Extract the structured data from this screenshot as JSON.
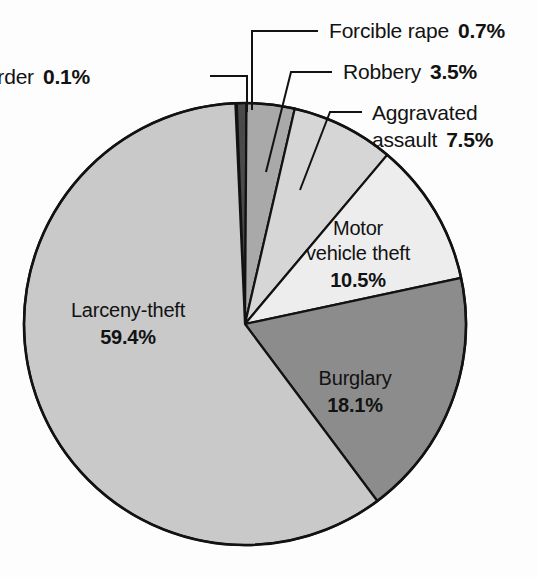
{
  "chart_data": {
    "type": "pie",
    "title": "",
    "subtitle": "",
    "xlabel": "",
    "ylabel": "",
    "legend_position": "none",
    "grid": false,
    "units": "percent",
    "total": 99.8,
    "categories": [
      "Murder",
      "Forcible rape",
      "Robbery",
      "Aggravated assault",
      "Motor vehicle theft",
      "Burglary",
      "Larceny-theft"
    ],
    "values": [
      0.1,
      0.7,
      3.5,
      7.5,
      10.5,
      18.1,
      59.4
    ],
    "slices": [
      {
        "name": "Murder",
        "label": "Murder",
        "value": 0.1,
        "value_text": "0.1%",
        "color": "#1e1e1e",
        "label_placement": "outside-left",
        "text_x": 90,
        "text_y": 84,
        "leader": "M 210 76 L 247 76 L 247 112"
      },
      {
        "name": "Forcible rape",
        "label": "Forcible rape",
        "value": 0.7,
        "value_text": "0.7%",
        "color": "#4a4a4a",
        "label_placement": "outside-right",
        "text_x": 329,
        "text_y": 38,
        "leader": "M 318 31 L 252 31 L 252 110"
      },
      {
        "name": "Robbery",
        "label": "Robbery",
        "value": 3.5,
        "value_text": "3.5%",
        "color": "#a9a9a9",
        "label_placement": "outside-right",
        "text_x": 343,
        "text_y": 79,
        "leader": "M 332 72 L 291 72 L 266 172"
      },
      {
        "name": "Aggravated assault",
        "label": "Aggravated assault",
        "label_line1": "Aggravated",
        "label_line2": "assault",
        "value": 7.5,
        "value_text": "7.5%",
        "color": "#d6d6d6",
        "label_placement": "outside-right",
        "text_x": 372,
        "text_y": 120,
        "leader": "M 362 112 L 330 112 L 300 190"
      },
      {
        "name": "Motor vehicle theft",
        "label": "Motor vehicle theft",
        "label_line1": "Motor",
        "label_line2": "vehicle theft",
        "value": 10.5,
        "value_text": "10.5%",
        "color": "#ededed",
        "label_placement": "inside",
        "text_x": 358,
        "text_y": 235
      },
      {
        "name": "Burglary",
        "label": "Burglary",
        "value": 18.1,
        "value_text": "18.1%",
        "color": "#8c8c8c",
        "label_placement": "inside",
        "text_x": 355,
        "text_y": 385
      },
      {
        "name": "Larceny-theft",
        "label": "Larceny-theft",
        "value": 59.4,
        "value_text": "59.4%",
        "color": "#c9c9c9",
        "label_placement": "inside",
        "text_x": 128,
        "text_y": 317
      }
    ],
    "geometry": {
      "center_x": 245,
      "center_y": 324,
      "radius": 221,
      "start_angle_deg": -92.5,
      "direction": "clockwise"
    },
    "colors": {
      "background": "#fdfdfd",
      "outline": "#121212",
      "text": "#121212"
    }
  }
}
